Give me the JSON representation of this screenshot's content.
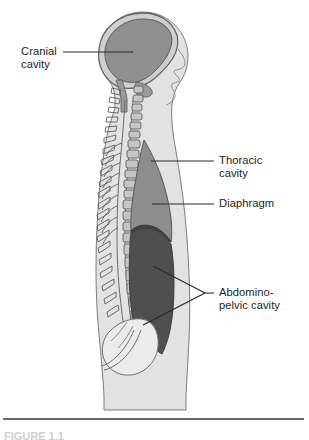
{
  "figure": {
    "background_color": "#ffffff"
  },
  "labels": [
    {
      "id": "cranial-cavity",
      "line1": "Cranial",
      "line2": "cavity",
      "align": "left"
    },
    {
      "id": "thoracic-cavity",
      "line1": "Thoracic",
      "line2": "cavity",
      "align": "left"
    },
    {
      "id": "diaphragm",
      "line1": "Diaphragm",
      "line2": "",
      "align": "left"
    },
    {
      "id": "abdominopelvic-cavity",
      "line1": "Abdomino-",
      "line2": "pelvic cavity",
      "align": "left"
    }
  ],
  "caption": {
    "text": "FIGURE 1.1"
  },
  "colors": {
    "body_fill": "#e2e2e2",
    "body_outline": "#6e6e6e",
    "cranial_cavity_fill": "#8f8f8f",
    "skull_fill": "#cfcfcf",
    "thoracic_cavity_fill": "#8d8d8d",
    "abdominopelvic_cavity_fill": "#4f4f4f",
    "vertebra_fill": "#c6c6c6",
    "pelvis_fill": "#ebebeb",
    "leader_line": "#2a2a2a",
    "rule": "#3a3a3a",
    "label_text": "#1d1d1d"
  }
}
